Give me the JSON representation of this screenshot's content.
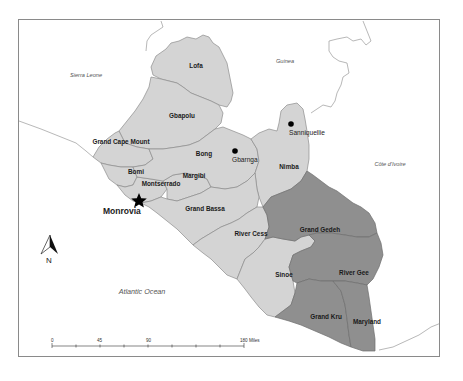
{
  "map": {
    "countries": {
      "sierra_leone": "Sierra Leone",
      "guinea": "Guinea",
      "cote_divoire": "Côte d'Ivoire"
    },
    "ocean": "Atlantic Ocean",
    "counties": {
      "lofa": "Lofa",
      "gbapolu": "Gbapolu",
      "grand_cape_mount": "Grand Cape Mount",
      "bong": "Bong",
      "bomi": "Bomi",
      "margibi": "Margibi",
      "montserrado": "Montserrado",
      "nimba": "Nimba",
      "grand_bassa": "Grand Bassa",
      "river_cess": "River Cess",
      "grand_gedeh": "Grand Gedeh",
      "sinoe": "Sinoe",
      "river_gee": "River Gee",
      "grand_kru": "Grand Kru",
      "maryland": "Maryland"
    },
    "highlighted_counties": [
      "Grand Gedeh",
      "River Gee",
      "Grand Kru",
      "Maryland"
    ],
    "cities": {
      "capital": "Monrovia",
      "gbarnga": "Gbarnga",
      "sanniquellie": "Sanniquellie"
    },
    "north_arrow": {
      "label": "N",
      "icon": "north-arrow-icon"
    },
    "scale_bar": {
      "ticks": [
        "0",
        "45",
        "90",
        "180 Miles"
      ]
    },
    "colors": {
      "light_county": "#d4d4d4",
      "highlight_county": "#8f8f8f",
      "border": "#8c8c8c"
    }
  }
}
